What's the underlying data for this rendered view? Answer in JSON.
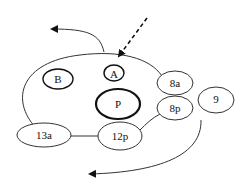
{
  "diagram": {
    "type": "cell-lineage-embryo",
    "nodes": [
      {
        "id": "B",
        "label": "B",
        "emphasis": "normal"
      },
      {
        "id": "A",
        "label": "A",
        "emphasis": "normal"
      },
      {
        "id": "P",
        "label": "P",
        "emphasis": "bold"
      },
      {
        "id": "8a",
        "label": "8a",
        "emphasis": "thin"
      },
      {
        "id": "8p",
        "label": "8p",
        "emphasis": "thin"
      },
      {
        "id": "9",
        "label": "9",
        "emphasis": "thin"
      },
      {
        "id": "13a",
        "label": "13a",
        "emphasis": "thin"
      },
      {
        "id": "12p",
        "label": "12p",
        "emphasis": "thin"
      }
    ],
    "arrows": [
      {
        "name": "incoming-dashed-arrow",
        "style": "dashed",
        "target": "A"
      },
      {
        "name": "top-left-curved-arrow",
        "style": "solid",
        "direction": "left"
      },
      {
        "name": "bottom-curved-arrow",
        "style": "solid",
        "direction": "left"
      }
    ],
    "colors": {
      "stroke": "#111111",
      "background": "#ffffff"
    }
  }
}
